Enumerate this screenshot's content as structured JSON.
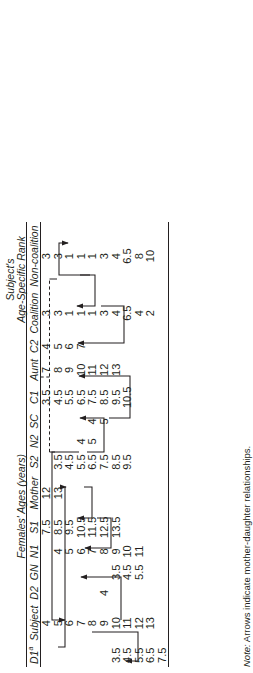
{
  "table": {
    "group_headers": [
      {
        "label": "Females' Ages (years)",
        "span_from": 2,
        "span_to": 8
      },
      {
        "label": "Subject's",
        "label2": "Age-Specific Rank",
        "span_from": 13,
        "span_to": 14
      }
    ],
    "group_label_females": "Females' Ages (years)",
    "group_label_subject_line1": "Subject's",
    "group_label_subject_line2": "Age-Specific Rank",
    "columns": [
      {
        "key": "d1",
        "label": "D1",
        "footnote": "a"
      },
      {
        "key": "subject",
        "label": "Subject",
        "footnote": ""
      },
      {
        "key": "d2",
        "label": "D2",
        "footnote": ""
      },
      {
        "key": "gn",
        "label": "GN",
        "footnote": ""
      },
      {
        "key": "n1",
        "label": "N1",
        "footnote": ""
      },
      {
        "key": "s1",
        "label": "S1",
        "footnote": ""
      },
      {
        "key": "mother",
        "label": "Mother",
        "footnote": ""
      },
      {
        "key": "s2",
        "label": "S2",
        "footnote": ""
      },
      {
        "key": "n2",
        "label": "N2",
        "footnote": ""
      },
      {
        "key": "sc",
        "label": "SC",
        "footnote": ""
      },
      {
        "key": "c1",
        "label": "C1",
        "footnote": ""
      },
      {
        "key": "aunt",
        "label": "Aunt",
        "footnote": ""
      },
      {
        "key": "c2",
        "label": "C2",
        "footnote": ""
      },
      {
        "key": "coalition",
        "label": "Coalition",
        "footnote": ""
      },
      {
        "key": "noncoalition",
        "label": "Non-coalition",
        "footnote": ""
      }
    ],
    "rows": [
      {
        "d1": "",
        "subject": "4",
        "d2": "",
        "gn": "",
        "n1": "",
        "s1": "7.5",
        "mother": "12",
        "s2": "",
        "n2": "",
        "sc": "",
        "c1": "3.5",
        "aunt": "7",
        "c2": "4",
        "coalition": "3",
        "noncoalition": "3"
      },
      {
        "d1": "",
        "subject": "5",
        "d2": "",
        "gn": "",
        "n1": "4",
        "s1": "8.5",
        "mother": "13",
        "s2": "3.5",
        "n2": "",
        "sc": "",
        "c1": "4.5",
        "aunt": "8",
        "c2": "5",
        "coalition": "3",
        "noncoalition": "3"
      },
      {
        "d1": "",
        "subject": "6",
        "d2": "",
        "gn": "",
        "n1": "5",
        "s1": "9.5",
        "mother": "",
        "s2": "4.5",
        "n2": "",
        "sc": "",
        "c1": "5.5",
        "aunt": "9",
        "c2": "6",
        "coalition": "1",
        "noncoalition": "1"
      },
      {
        "d1": "",
        "subject": "7",
        "d2": "",
        "gn": "",
        "n1": "6",
        "s1": "10.5",
        "mother": "",
        "s2": "5.5",
        "n2": "4",
        "sc": "",
        "c1": "6.5",
        "aunt": "10",
        "c2": "7",
        "coalition": "1",
        "noncoalition": "1"
      },
      {
        "d1": "",
        "subject": "8",
        "d2": "",
        "gn": "",
        "n1": "7",
        "s1": "11.5",
        "mother": "",
        "s2": "6.5",
        "n2": "5",
        "sc": "4",
        "c1": "7.5",
        "aunt": "11",
        "c2": "",
        "coalition": "1",
        "noncoalition": "1"
      },
      {
        "d1": "",
        "subject": "9",
        "d2": "4",
        "gn": "",
        "n1": "8",
        "s1": "12.5",
        "mother": "",
        "s2": "7.5",
        "n2": "",
        "sc": "5",
        "c1": "8.5",
        "aunt": "12",
        "c2": "",
        "coalition": "3",
        "noncoalition": "3"
      },
      {
        "d1": "3.5",
        "subject": "10",
        "d2": "",
        "gn": "3.5",
        "n1": "9",
        "s1": "13.5",
        "mother": "",
        "s2": "8.5",
        "n2": "",
        "sc": "",
        "c1": "9.5",
        "aunt": "13",
        "c2": "",
        "coalition": "4",
        "noncoalition": "4"
      },
      {
        "d1": "4.5",
        "subject": "11",
        "d2": "",
        "gn": "4.5",
        "n1": "10",
        "s1": "",
        "mother": "",
        "s2": "9.5",
        "n2": "",
        "sc": "",
        "c1": "10.5",
        "aunt": "",
        "c2": "",
        "coalition": "6.5",
        "noncoalition": "6.5"
      },
      {
        "d1": "5.5",
        "subject": "12",
        "d2": "",
        "gn": "5.5",
        "n1": "11",
        "s1": "",
        "mother": "",
        "s2": "",
        "n2": "",
        "sc": "",
        "c1": "",
        "aunt": "",
        "c2": "",
        "coalition": "4",
        "noncoalition": "8"
      },
      {
        "d1": "6.5",
        "subject": "13",
        "d2": "",
        "gn": "",
        "n1": "",
        "s1": "",
        "mother": "",
        "s2": "",
        "n2": "",
        "sc": "",
        "c1": "",
        "aunt": "",
        "c2": "",
        "coalition": "2",
        "noncoalition": "10"
      },
      {
        "d1": "7.5",
        "subject": "",
        "d2": "",
        "gn": "",
        "n1": "",
        "s1": "",
        "mother": "",
        "s2": "",
        "n2": "",
        "sc": "",
        "c1": "",
        "aunt": "",
        "c2": "",
        "coalition": "",
        "noncoalition": ""
      }
    ]
  },
  "note": {
    "prefix": "Note:",
    "text": " Arrows indicate mother-daughter relationships."
  },
  "relationships": [
    {
      "from": "subject",
      "to": "d1",
      "label": "subject-to-d1"
    },
    {
      "from": "subject",
      "to": "s1",
      "label": "subject-to-s1"
    },
    {
      "from": "s1",
      "to": "n1",
      "label": "s1-to-n1"
    },
    {
      "from": "n1",
      "to": "gn",
      "label": "n1-to-gn"
    },
    {
      "from": "mother",
      "to": "subject",
      "label": "mother-to-subject"
    },
    {
      "from": "mother",
      "to": "s2",
      "label": "mother-to-s2"
    },
    {
      "from": "s2",
      "to": "n2",
      "label": "s2-to-n2"
    },
    {
      "from": "c1",
      "to": "sc",
      "label": "c1-to-sc"
    },
    {
      "from": "aunt",
      "to": "c1",
      "label": "aunt-to-c1"
    },
    {
      "from": "aunt",
      "to": "c2",
      "label": "aunt-to-c2"
    },
    {
      "from": "d2",
      "to": "subject",
      "label": "d2-to-subject"
    },
    {
      "from": "mother",
      "to": "aunt",
      "label": "mother-to-aunt-dashed",
      "style": "dashed"
    }
  ],
  "colors": {
    "ink": "#231f20",
    "rule": "#231f20",
    "arrow": "#231f20"
  }
}
